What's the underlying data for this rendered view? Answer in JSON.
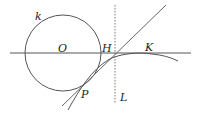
{
  "labels": {
    "k": "k",
    "O": "O",
    "H": "H",
    "K": "K",
    "P": "P",
    "L": "L"
  },
  "colors": {
    "stroke": "#444444",
    "text": "#222222",
    "background": "#ffffff"
  }
}
